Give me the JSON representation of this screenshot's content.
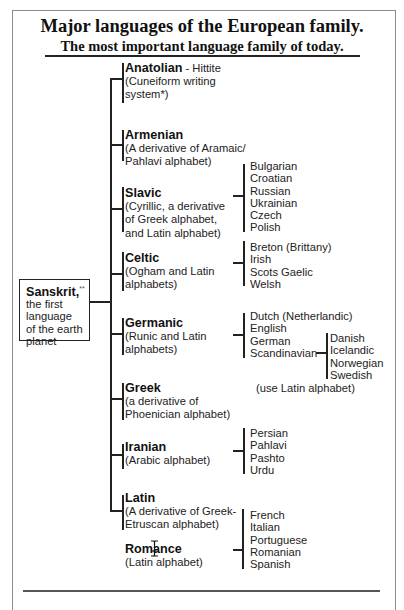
{
  "header": {
    "title": "Major languages of the European family.",
    "subtitle": "The most important language family of today."
  },
  "root": {
    "name": "Sanskrit,",
    "marker": "**",
    "desc_lines": [
      "the first",
      "language",
      "of the earth",
      "planet"
    ]
  },
  "branches": [
    {
      "name": "Anatolian",
      "suffix": " - Hittite",
      "desc_lines": [
        "(Cuneiform writing",
        "system*)"
      ]
    },
    {
      "name": "Armenian",
      "desc_lines": [
        "(A derivative of Aramaic/",
        "Pahlavi alphabet)"
      ]
    },
    {
      "name": "Slavic",
      "desc_lines": [
        "(Cyrillic, a derivative",
        "of Greek alphabet,",
        "and Latin alphabet)"
      ],
      "children": [
        "Bulgarian",
        "Croatian",
        "Russian",
        "Ukrainian",
        "Czech",
        "Polish"
      ]
    },
    {
      "name": "Celtic",
      "desc_lines": [
        "(Ogham and Latin",
        "alphabets)"
      ],
      "children": [
        "Breton (Brittany)",
        "Irish",
        "Scots Gaelic",
        "Welsh"
      ]
    },
    {
      "name": "Germanic",
      "desc_lines": [
        "(Runic and Latin",
        "alphabets)"
      ],
      "children": [
        "Dutch (Netherlandic)",
        "English",
        "German",
        "Scandinavian"
      ],
      "sub_children": [
        "Danish",
        "Icelandic",
        "Norwegian",
        "Swedish"
      ],
      "note": "(use Latin alphabet)"
    },
    {
      "name": "Greek",
      "desc_lines": [
        "(a derivative of",
        "Phoenician alphabet)"
      ]
    },
    {
      "name": "Iranian",
      "desc_lines": [
        "(Arabic alphabet)"
      ],
      "children": [
        "Persian",
        "Pahlavi",
        "Pashto",
        "Urdu"
      ]
    },
    {
      "name": "Latin",
      "desc_lines": [
        "(A derivative of Greek-",
        "Etruscan alphabet)"
      ]
    },
    {
      "name": "Romance",
      "desc_lines": [
        "(Latin alphabet)"
      ],
      "children": [
        "French",
        "Italian",
        "Portuguese",
        "Romanian",
        "Spanish"
      ]
    }
  ],
  "cursor": {
    "type": "text-ibeam-cursor"
  }
}
